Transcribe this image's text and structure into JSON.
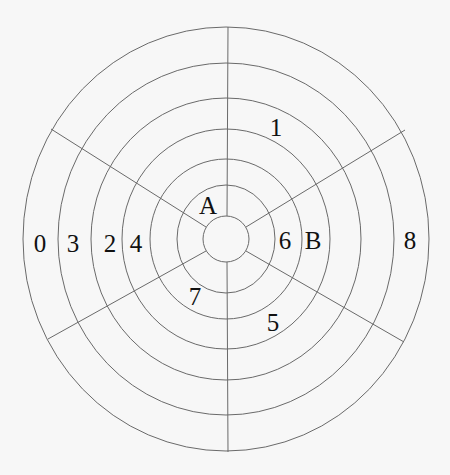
{
  "diagram": {
    "title": "",
    "type": "concentric rings with radial spokes",
    "center": {
      "x": 226,
      "y": 239
    },
    "rings": [
      {
        "rx": 23,
        "ry": 23
      },
      {
        "rx": 49,
        "ry": 54
      },
      {
        "rx": 76,
        "ry": 80
      },
      {
        "rx": 104,
        "ry": 110
      },
      {
        "rx": 135,
        "ry": 141
      },
      {
        "rx": 168,
        "ry": 176
      },
      {
        "rx": 203,
        "ry": 212
      }
    ],
    "spokes": [
      {
        "name": "top",
        "x1": 227,
        "y1": 216,
        "x2": 228,
        "y2": 27
      },
      {
        "name": "bottom",
        "x1": 227,
        "y1": 262,
        "x2": 228,
        "y2": 452
      },
      {
        "name": "upper-left",
        "x1": 206,
        "y1": 227,
        "x2": 51,
        "y2": 129
      },
      {
        "name": "upper-right",
        "x1": 246,
        "y1": 227,
        "x2": 405,
        "y2": 130
      },
      {
        "name": "lower-left",
        "x1": 206,
        "y1": 251,
        "x2": 48,
        "y2": 339
      },
      {
        "name": "lower-right",
        "x1": 246,
        "y1": 251,
        "x2": 404,
        "y2": 342
      }
    ],
    "labels": [
      {
        "text": "1",
        "x": 276,
        "y": 127
      },
      {
        "text": "A",
        "x": 208,
        "y": 205
      },
      {
        "text": "6",
        "x": 285,
        "y": 240
      },
      {
        "text": "B",
        "x": 313,
        "y": 240
      },
      {
        "text": "8",
        "x": 410,
        "y": 240
      },
      {
        "text": "0",
        "x": 40,
        "y": 243
      },
      {
        "text": "3",
        "x": 73,
        "y": 243
      },
      {
        "text": "2",
        "x": 110,
        "y": 243
      },
      {
        "text": "4",
        "x": 136,
        "y": 243
      },
      {
        "text": "7",
        "x": 195,
        "y": 296
      },
      {
        "text": "5",
        "x": 273,
        "y": 322
      }
    ],
    "colors": {
      "line": "#6a6a6a",
      "text": "#111111",
      "background": "#f7f7f7"
    }
  }
}
